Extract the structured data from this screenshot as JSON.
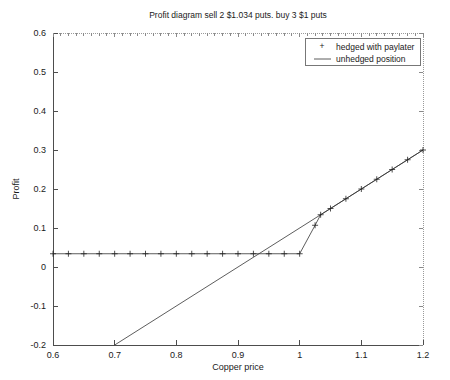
{
  "chart_data": {
    "type": "line",
    "title": "Profit diagram sell 2 $1.034 puts. buy 3 $1 puts",
    "xlabel": "Copper price",
    "ylabel": "Profit",
    "xlim": [
      0.6,
      1.2
    ],
    "ylim": [
      -0.2,
      0.6
    ],
    "xticks": [
      0.6,
      0.7,
      0.8,
      0.9,
      1,
      1.1,
      1.2
    ],
    "xticklabels": [
      "0.6",
      "0.7",
      "0.8",
      "0.9",
      "1",
      "1.1",
      "1.2"
    ],
    "yticks": [
      -0.2,
      -0.1,
      0,
      0.1,
      0.2,
      0.3,
      0.4,
      0.5,
      0.6
    ],
    "yticklabels": [
      "-0.2",
      "-0.1",
      "0",
      "0.1",
      "0.2",
      "0.3",
      "0.4",
      "0.5",
      "0.6"
    ],
    "grid": false,
    "legend_position": "upper right",
    "series": [
      {
        "name": "hedged with paylater",
        "marker": "+",
        "style": "line-with-markers",
        "points": [
          {
            "x": 0.6,
            "y": 0.034
          },
          {
            "x": 0.625,
            "y": 0.034
          },
          {
            "x": 0.65,
            "y": 0.034
          },
          {
            "x": 0.675,
            "y": 0.034
          },
          {
            "x": 0.7,
            "y": 0.034
          },
          {
            "x": 0.725,
            "y": 0.034
          },
          {
            "x": 0.75,
            "y": 0.034
          },
          {
            "x": 0.775,
            "y": 0.034
          },
          {
            "x": 0.8,
            "y": 0.034
          },
          {
            "x": 0.825,
            "y": 0.034
          },
          {
            "x": 0.85,
            "y": 0.034
          },
          {
            "x": 0.875,
            "y": 0.034
          },
          {
            "x": 0.9,
            "y": 0.034
          },
          {
            "x": 0.925,
            "y": 0.034
          },
          {
            "x": 0.95,
            "y": 0.034
          },
          {
            "x": 0.975,
            "y": 0.034
          },
          {
            "x": 1.0,
            "y": 0.034
          },
          {
            "x": 1.025,
            "y": 0.107
          },
          {
            "x": 1.034,
            "y": 0.134
          },
          {
            "x": 1.05,
            "y": 0.15
          },
          {
            "x": 1.075,
            "y": 0.175
          },
          {
            "x": 1.1,
            "y": 0.2
          },
          {
            "x": 1.125,
            "y": 0.225
          },
          {
            "x": 1.15,
            "y": 0.25
          },
          {
            "x": 1.175,
            "y": 0.275
          },
          {
            "x": 1.2,
            "y": 0.3
          }
        ]
      },
      {
        "name": "unhedged position",
        "marker": "none",
        "style": "line",
        "points": [
          {
            "x": 0.7,
            "y": -0.2
          },
          {
            "x": 1.2,
            "y": 0.3
          }
        ]
      }
    ],
    "legend_entries": [
      {
        "label": "hedged with paylater",
        "marker": "+"
      },
      {
        "label": "unhedged position",
        "marker": "line"
      }
    ]
  }
}
